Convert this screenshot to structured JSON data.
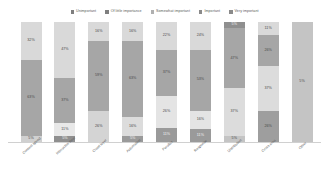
{
  "chart_data": {
    "type": "bar",
    "subtype": "stacked-bar-100",
    "title": "",
    "xlabel": "",
    "ylabel": "",
    "ylim": [
      0,
      100
    ],
    "grid": false,
    "legend_position": "top-center",
    "categories": [
      "Content speed",
      "Interactive time",
      "Crawl layer",
      "Automation",
      "Parallax",
      "Response",
      "Distribution",
      "Cross area",
      "Other"
    ],
    "series": [
      {
        "name": "Unimportant",
        "color": "#7f7f7f",
        "values": [
          5,
          5,
          0,
          5,
          11,
          11,
          5,
          0,
          0
        ]
      },
      {
        "name": "Of little importance",
        "color": "#d9d9d9",
        "values": [
          0,
          11,
          26,
          16,
          26,
          16,
          37,
          26,
          0
        ]
      },
      {
        "name": "Somewhat important",
        "color": "#a6a6a6",
        "values": [
          63,
          43,
          59,
          63,
          37,
          53,
          47,
          26,
          95
        ]
      },
      {
        "name": "Important",
        "color": "#d9d9d9",
        "values": [
          32,
          47,
          16,
          16,
          22,
          24,
          5,
          37,
          0
        ]
      },
      {
        "name": "Very important",
        "color": "#bfbfbf",
        "values": [
          0,
          0,
          0,
          0,
          0,
          0,
          5,
          11,
          5
        ]
      }
    ],
    "bars": [
      {
        "category": "Content speed",
        "segments": [
          {
            "series": "Important",
            "value": 32,
            "label": "32%",
            "color": "#d9d9d9",
            "dark": false
          },
          {
            "series": "Somewhat important",
            "value": 63,
            "label": "63%",
            "color": "#a6a6a6",
            "dark": false
          },
          {
            "series": "Unimportant",
            "value": 5,
            "label": "5%",
            "color": "#d0d0d0",
            "dark": false
          }
        ]
      },
      {
        "category": "Interactive time",
        "segments": [
          {
            "series": "Important",
            "value": 47,
            "label": "47%",
            "color": "#d9d9d9",
            "dark": false
          },
          {
            "series": "Somewhat important",
            "value": 37,
            "label": "37%",
            "color": "#a6a6a6",
            "dark": false
          },
          {
            "series": "Of little importance",
            "value": 11,
            "label": "11%",
            "color": "#e8e8e8",
            "dark": false
          },
          {
            "series": "Unimportant",
            "value": 5,
            "label": "5%",
            "color": "#8f8f8f",
            "dark": true
          }
        ]
      },
      {
        "category": "Crawl layer",
        "segments": [
          {
            "series": "Important",
            "value": 16,
            "label": "16%",
            "color": "#d9d9d9",
            "dark": false
          },
          {
            "series": "Somewhat important",
            "value": 59,
            "label": "59%",
            "color": "#a6a6a6",
            "dark": false
          },
          {
            "series": "Of little importance",
            "value": 26,
            "label": "26%",
            "color": "#d4d4d4",
            "dark": false
          }
        ]
      },
      {
        "category": "Automation",
        "segments": [
          {
            "series": "Important",
            "value": 16,
            "label": "16%",
            "color": "#d9d9d9",
            "dark": false
          },
          {
            "series": "Somewhat important",
            "value": 63,
            "label": "63%",
            "color": "#a6a6a6",
            "dark": false
          },
          {
            "series": "Of little importance",
            "value": 16,
            "label": "16%",
            "color": "#dcdcdc",
            "dark": false
          },
          {
            "series": "Unimportant",
            "value": 5,
            "label": "5%",
            "color": "#9a9a9a",
            "dark": true
          }
        ]
      },
      {
        "category": "Parallax",
        "segments": [
          {
            "series": "Important",
            "value": 22,
            "label": "22%",
            "color": "#d9d9d9",
            "dark": false
          },
          {
            "series": "Somewhat important",
            "value": 37,
            "label": "37%",
            "color": "#a6a6a6",
            "dark": false
          },
          {
            "series": "Of little importance",
            "value": 26,
            "label": "26%",
            "color": "#e4e4e4",
            "dark": false
          },
          {
            "series": "Unimportant",
            "value": 11,
            "label": "11%",
            "color": "#9a9a9a",
            "dark": true
          }
        ]
      },
      {
        "category": "Response",
        "segments": [
          {
            "series": "Important",
            "value": 24,
            "label": "24%",
            "color": "#d9d9d9",
            "dark": false
          },
          {
            "series": "Somewhat important",
            "value": 53,
            "label": "53%",
            "color": "#a6a6a6",
            "dark": false
          },
          {
            "series": "Of little importance",
            "value": 16,
            "label": "16%",
            "color": "#e4e4e4",
            "dark": false
          },
          {
            "series": "Unimportant",
            "value": 11,
            "label": "11%",
            "color": "#9a9a9a",
            "dark": true
          }
        ]
      },
      {
        "category": "Distribution",
        "segments": [
          {
            "series": "Very important",
            "value": 5,
            "label": "5%",
            "color": "#8f8f8f",
            "dark": true
          },
          {
            "series": "Somewhat important",
            "value": 47,
            "label": "47%",
            "color": "#a6a6a6",
            "dark": false
          },
          {
            "series": "Of little importance",
            "value": 37,
            "label": "37%",
            "color": "#dcdcdc",
            "dark": false
          },
          {
            "series": "Unimportant",
            "value": 5,
            "label": "5%",
            "color": "#c4c4c4",
            "dark": false
          }
        ]
      },
      {
        "category": "Cross area",
        "segments": [
          {
            "series": "Very important",
            "value": 11,
            "label": "11%",
            "color": "#d9d9d9",
            "dark": false
          },
          {
            "series": "Somewhat important",
            "value": 26,
            "label": "26%",
            "color": "#a6a6a6",
            "dark": false
          },
          {
            "series": "Of little importance",
            "value": 37,
            "label": "37%",
            "color": "#dcdcdc",
            "dark": false
          },
          {
            "series": "Important",
            "value": 26,
            "label": "26%",
            "color": "#9e9e9e",
            "dark": false
          }
        ]
      },
      {
        "category": "Other",
        "segments": [
          {
            "series": "Somewhat important",
            "value": 95,
            "label": "5%",
            "color": "#c4c4c4",
            "dark": false
          }
        ]
      }
    ]
  },
  "legend": {
    "items": [
      {
        "label": "Unimportant",
        "color": "#7f7f7f"
      },
      {
        "label": "Of little importance",
        "color": "#7f7f7f"
      },
      {
        "label": "Somewhat important",
        "color": "#b0b0b0"
      },
      {
        "label": "Important",
        "color": "#8a8a8a"
      },
      {
        "label": "Very important",
        "color": "#8a8a8a"
      }
    ]
  }
}
